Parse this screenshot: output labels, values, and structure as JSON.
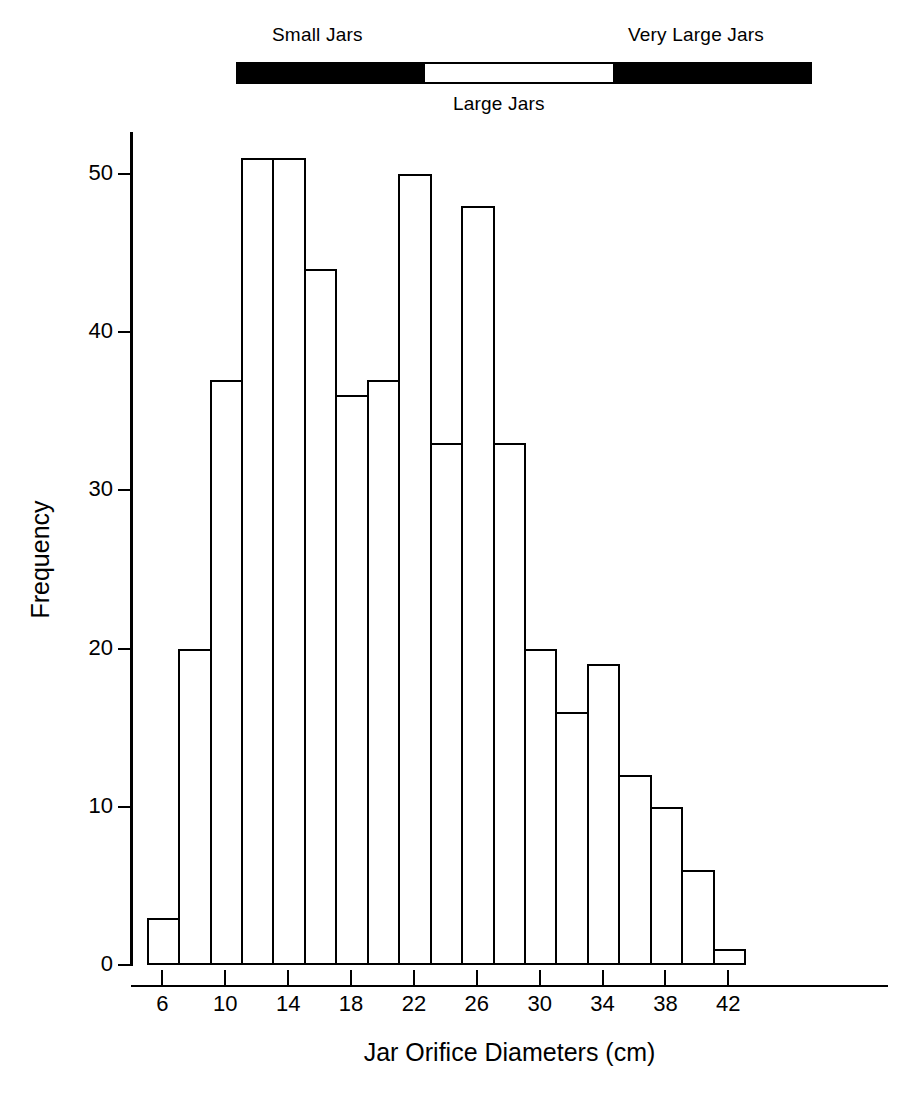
{
  "chart_data": {
    "type": "bar",
    "title": "",
    "xlabel": "Jar Orifice Diameters (cm)",
    "ylabel": "Frequency",
    "xlim": [
      4,
      44
    ],
    "ylim": [
      0,
      54
    ],
    "grid": false,
    "legend_position": "top",
    "bin_width": 2,
    "bin_starts": [
      5,
      7,
      9,
      11,
      13,
      15,
      17,
      19,
      21,
      23,
      25,
      27,
      29,
      31,
      33,
      35,
      37,
      39,
      41
    ],
    "bin_centers": [
      6,
      8,
      10,
      12,
      14,
      16,
      18,
      20,
      22,
      24,
      26,
      28,
      30,
      32,
      34,
      36,
      38,
      40,
      42
    ],
    "categories": [
      "5-7",
      "7-9",
      "9-11",
      "11-13",
      "13-15",
      "15-17",
      "17-19",
      "19-21",
      "21-23",
      "23-25",
      "25-27",
      "27-29",
      "29-31",
      "31-33",
      "33-35",
      "35-37",
      "37-39",
      "39-41",
      "41-43"
    ],
    "values": [
      3,
      20,
      37,
      51,
      51,
      44,
      36,
      37,
      50,
      33,
      48,
      33,
      20,
      16,
      19,
      12,
      10,
      6,
      1
    ],
    "xticks": [
      6,
      10,
      14,
      18,
      22,
      26,
      30,
      34,
      38,
      42
    ],
    "xtick_labels": [
      "6",
      "10",
      "14",
      "18",
      "22",
      "26",
      "30",
      "34",
      "38",
      "42"
    ],
    "yticks": [
      0,
      10,
      20,
      30,
      40,
      50
    ],
    "ytick_labels": [
      "0",
      "10",
      "20",
      "30",
      "40",
      "50"
    ],
    "annotations": [
      {
        "label": "Small Jars",
        "range": [
          5,
          19
        ],
        "fill": "#000000"
      },
      {
        "label": "Large Jars",
        "range": [
          19,
          26
        ],
        "fill": "#ffffff"
      },
      {
        "label": "Very Large Jars",
        "range": [
          26,
          43
        ],
        "fill": "#000000"
      }
    ]
  },
  "legend": {
    "small_jars": "Small Jars",
    "large_jars": "Large Jars",
    "very_large_jars": "Very Large Jars"
  },
  "colors": {
    "bar_outline": "#000000",
    "bar_fill": "#ffffff",
    "axis": "#000000",
    "background": "#ffffff",
    "category_fill": "#000000"
  }
}
